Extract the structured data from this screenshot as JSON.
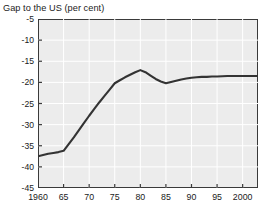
{
  "axis_title": "Gap to the US (per cent)",
  "chart_data": {
    "type": "line",
    "title": "",
    "subtitle": "",
    "xlabel": "",
    "ylabel": "Gap to the US (per cent)",
    "xlim": [
      1960,
      2003
    ],
    "ylim": [
      -45,
      -5
    ],
    "yticks": [
      -5,
      -10,
      -15,
      -20,
      -25,
      -30,
      -35,
      -40,
      -45
    ],
    "ytick_labels": [
      "-5",
      "-10",
      "-15",
      "-20",
      "-25",
      "-30",
      "-35",
      "-40",
      "-45"
    ],
    "xticks": [
      1960,
      1965,
      1970,
      1975,
      1980,
      1985,
      1990,
      1995,
      2000
    ],
    "xtick_labels": [
      "1960",
      "65",
      "70",
      "75",
      "80",
      "85",
      "90",
      "95",
      "2000"
    ],
    "grid": true,
    "grid_color": "#ffffff",
    "plot_background": "#ececec",
    "line_color": "#333333",
    "legend": null,
    "annotations": [],
    "series": [
      {
        "name": "Gap to the US",
        "color": "#333333",
        "x": [
          1960,
          1961,
          1962,
          1963,
          1964,
          1965,
          1966,
          1967,
          1968,
          1969,
          1970,
          1971,
          1972,
          1973,
          1974,
          1975,
          1976,
          1977,
          1978,
          1979,
          1980,
          1981,
          1982,
          1983,
          1984,
          1985,
          1986,
          1987,
          1988,
          1989,
          1990,
          1991,
          1992,
          1993,
          1994,
          1995,
          1996,
          1997,
          1998,
          1999,
          2000,
          2001,
          2002,
          2003
        ],
        "values": [
          -37.5,
          -37.2,
          -36.9,
          -36.7,
          -36.5,
          -36.2,
          -34.6,
          -33.0,
          -31.3,
          -29.6,
          -27.9,
          -26.3,
          -24.7,
          -23.2,
          -21.7,
          -20.2,
          -19.5,
          -18.8,
          -18.2,
          -17.6,
          -17.1,
          -17.6,
          -18.4,
          -19.2,
          -19.8,
          -20.2,
          -19.9,
          -19.6,
          -19.3,
          -19.1,
          -18.9,
          -18.8,
          -18.7,
          -18.7,
          -18.6,
          -18.6,
          -18.55,
          -18.5,
          -18.5,
          -18.5,
          -18.5,
          -18.5,
          -18.5,
          -18.5
        ]
      }
    ]
  }
}
